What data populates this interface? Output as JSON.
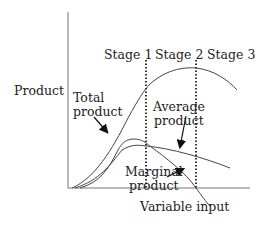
{
  "diagram": {
    "ylabel": "Product",
    "xlabel": "Variable input",
    "stages": [
      "Stage 1",
      "Stage 2",
      "Stage 3"
    ],
    "curves": {
      "total": "Total\nproduct",
      "average": "Average\nproduct",
      "marginal": "Marginal\nproduct"
    },
    "colors": {
      "line": "#444444",
      "axis": "#777777",
      "text": "#222222"
    }
  }
}
